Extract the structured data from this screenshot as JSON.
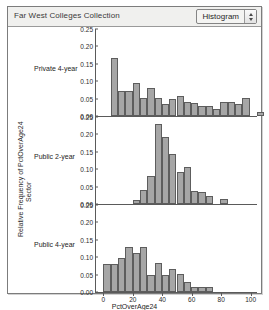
{
  "window": {
    "title": "Far West Colleges Collection"
  },
  "toolbar": {
    "plot_type_label": "Histogram",
    "plot_type_options": [
      "Histogram"
    ],
    "stepper_up_icon": "triangle-up-icon",
    "stepper_down_icon": "triangle-down-icon"
  },
  "colors": {
    "bar_fill": "#a6a6a6",
    "bar_stroke": "#5d5d5d",
    "axis": "#5a5a5a",
    "titlebar_bg": "#f0f0ee",
    "window_border": "#7c7c7c"
  },
  "chart_data": {
    "type": "bar",
    "title": "Far West Colleges Collection",
    "xlabel": "PctOverAge24",
    "ylabel": "Relative Frequency of PctOverAge24",
    "group_axis_label": "Sector",
    "grid": false,
    "legend": "none",
    "xlim": [
      -5,
      105
    ],
    "ylim": [
      0.0,
      0.25
    ],
    "xticks": [
      0,
      20,
      40,
      60,
      80,
      100
    ],
    "yticks": [
      "0.25",
      "0.20",
      "0.15",
      "0.10",
      "0.05",
      "0.00"
    ],
    "ytick_values": [
      0.25,
      0.2,
      0.15,
      0.1,
      0.05,
      0.0
    ],
    "bin_width": 5,
    "panels": [
      {
        "name": "Private 4-year",
        "bins": [
          {
            "x0": 5,
            "x1": 10,
            "value": 0.17
          },
          {
            "x0": 10,
            "x1": 15,
            "value": 0.072
          },
          {
            "x0": 15,
            "x1": 20,
            "value": 0.072
          },
          {
            "x0": 20,
            "x1": 25,
            "value": 0.096
          },
          {
            "x0": 25,
            "x1": 30,
            "value": 0.052
          },
          {
            "x0": 30,
            "x1": 35,
            "value": 0.08
          },
          {
            "x0": 35,
            "x1": 40,
            "value": 0.052
          },
          {
            "x0": 40,
            "x1": 45,
            "value": 0.036
          },
          {
            "x0": 45,
            "x1": 50,
            "value": 0.05
          },
          {
            "x0": 50,
            "x1": 55,
            "value": 0.058
          },
          {
            "x0": 55,
            "x1": 60,
            "value": 0.04
          },
          {
            "x0": 60,
            "x1": 65,
            "value": 0.038
          },
          {
            "x0": 65,
            "x1": 70,
            "value": 0.03
          },
          {
            "x0": 70,
            "x1": 75,
            "value": 0.028
          },
          {
            "x0": 75,
            "x1": 80,
            "value": 0.02
          },
          {
            "x0": 80,
            "x1": 85,
            "value": 0.04
          },
          {
            "x0": 85,
            "x1": 90,
            "value": 0.04
          },
          {
            "x0": 90,
            "x1": 95,
            "value": 0.034
          },
          {
            "x0": 95,
            "x1": 100,
            "value": 0.052
          },
          {
            "x0": 105,
            "x1": 110,
            "value": 0.012
          }
        ]
      },
      {
        "name": "Public 2-year",
        "bins": [
          {
            "x0": 20,
            "x1": 25,
            "value": 0.012
          },
          {
            "x0": 25,
            "x1": 30,
            "value": 0.042
          },
          {
            "x0": 30,
            "x1": 35,
            "value": 0.082
          },
          {
            "x0": 35,
            "x1": 40,
            "value": 0.232
          },
          {
            "x0": 40,
            "x1": 45,
            "value": 0.196
          },
          {
            "x0": 45,
            "x1": 50,
            "value": 0.144
          },
          {
            "x0": 50,
            "x1": 55,
            "value": 0.094
          },
          {
            "x0": 55,
            "x1": 60,
            "value": 0.108
          },
          {
            "x0": 60,
            "x1": 65,
            "value": 0.038
          },
          {
            "x0": 65,
            "x1": 70,
            "value": 0.036
          },
          {
            "x0": 70,
            "x1": 75,
            "value": 0.024
          },
          {
            "x0": 80,
            "x1": 85,
            "value": 0.016
          }
        ]
      },
      {
        "name": "Public 4-year",
        "bins": [
          {
            "x0": 0,
            "x1": 5,
            "value": 0.08
          },
          {
            "x0": 5,
            "x1": 10,
            "value": 0.08
          },
          {
            "x0": 10,
            "x1": 15,
            "value": 0.1
          },
          {
            "x0": 15,
            "x1": 20,
            "value": 0.13
          },
          {
            "x0": 20,
            "x1": 25,
            "value": 0.112
          },
          {
            "x0": 25,
            "x1": 30,
            "value": 0.13
          },
          {
            "x0": 30,
            "x1": 35,
            "value": 0.05
          },
          {
            "x0": 35,
            "x1": 40,
            "value": 0.084
          },
          {
            "x0": 40,
            "x1": 45,
            "value": 0.05
          },
          {
            "x0": 45,
            "x1": 50,
            "value": 0.066
          },
          {
            "x0": 50,
            "x1": 55,
            "value": 0.052
          },
          {
            "x0": 55,
            "x1": 60,
            "value": 0.03
          },
          {
            "x0": 60,
            "x1": 65,
            "value": 0.014
          },
          {
            "x0": 65,
            "x1": 70,
            "value": 0.014
          },
          {
            "x0": 70,
            "x1": 75,
            "value": 0.014
          }
        ]
      }
    ]
  }
}
